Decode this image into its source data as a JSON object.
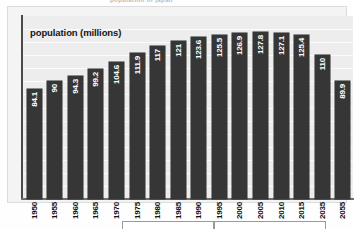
{
  "document": {
    "top_title": "population of japan"
  },
  "chart": {
    "axis_title": "population (millions)",
    "plot_background": "#ededed",
    "bar_color": "#363636",
    "gridline_color": "#fbfbfb",
    "value_label_color": "#ffffff",
    "gridline_count": 13
  },
  "chart_data": {
    "type": "bar",
    "title": "population of japan",
    "xlabel": "",
    "ylabel": "population (millions)",
    "ylim": [
      0,
      140
    ],
    "grid": true,
    "legend": "none",
    "categories": [
      "1950",
      "1955",
      "1960",
      "1965",
      "1970",
      "1975",
      "1980",
      "1985",
      "1990",
      "1995",
      "2000",
      "2005",
      "2010",
      "2015",
      "2035",
      "2055"
    ],
    "values": [
      84.1,
      90,
      94.3,
      99.2,
      104.6,
      111.9,
      117,
      121,
      123.6,
      125.5,
      126.9,
      127.8,
      127.1,
      125.4,
      110,
      89.9
    ],
    "value_labels": [
      "84.1",
      "90",
      "94.3",
      "99.2",
      "104.6",
      "111.9",
      "117",
      "121",
      "123.6",
      "125.5",
      "126.9",
      "127.8",
      "127.1",
      "125.4",
      "110",
      "89.9"
    ]
  },
  "bottom_boxes": [
    {
      "name": "table-box-left",
      "label": ""
    },
    {
      "name": "table-box-right",
      "label": ""
    }
  ]
}
